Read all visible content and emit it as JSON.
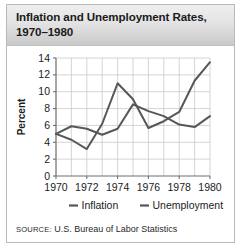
{
  "title": {
    "line1": "Inflation and Unemployment Rates,",
    "line2": "1970–1980"
  },
  "source": {
    "label": "SOURCE:",
    "text": "U.S. Bureau of Labor Statistics"
  },
  "colors": {
    "line": "#575757",
    "grid": "#c9c9c9",
    "axis": "#6f6f6f",
    "text": "#1c1c1c",
    "frame": "#b9b9b9",
    "header_top": "#efefef",
    "header_bottom": "#c9c9c9",
    "background": "#ffffff"
  },
  "chart_data": {
    "type": "line",
    "title": "Inflation and Unemployment Rates, 1970–1980",
    "xlabel": "",
    "ylabel": "Percent",
    "x": [
      1970,
      1971,
      1972,
      1973,
      1974,
      1975,
      1976,
      1977,
      1978,
      1979,
      1980
    ],
    "xtick_labels": [
      "1970",
      "1972",
      "1974",
      "1976",
      "1978",
      "1980"
    ],
    "xtick_values": [
      1970,
      1972,
      1974,
      1976,
      1978,
      1980
    ],
    "xlim": [
      1970,
      1980
    ],
    "ylim": [
      0,
      14
    ],
    "ytick_values": [
      0,
      2,
      4,
      6,
      8,
      10,
      12,
      14
    ],
    "ytick_labels": [
      "0",
      "2",
      "4",
      "6",
      "8",
      "10",
      "12",
      "14"
    ],
    "grid": true,
    "legend_position": "bottom",
    "series": [
      {
        "name": "Inflation",
        "values": [
          5.0,
          4.3,
          3.2,
          6.2,
          11.0,
          9.1,
          5.7,
          6.5,
          7.6,
          11.3,
          13.5
        ]
      },
      {
        "name": "Unemployment",
        "values": [
          5.0,
          5.9,
          5.6,
          4.9,
          5.6,
          8.5,
          7.7,
          7.1,
          6.1,
          5.8,
          7.1
        ]
      }
    ]
  }
}
